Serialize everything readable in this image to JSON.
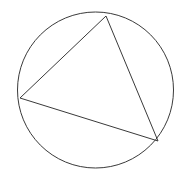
{
  "figure": {
    "background_color": "#ffffff",
    "stroke_color": "#3a3a3a",
    "stroke_width": 1,
    "canvas": {
      "width": 190,
      "height": 181
    },
    "circle": {
      "name": "circumscribed-circle",
      "center_x": 95.5,
      "center_y": 90,
      "radius": 78,
      "fill": "none"
    },
    "triangle": {
      "name": "inscribed-triangle",
      "fill": "none",
      "points": "106,16 20,98 158,141",
      "vertices": [
        {
          "label": "",
          "x": 106,
          "y": 16
        },
        {
          "label": "",
          "x": 20,
          "y": 98
        },
        {
          "label": "",
          "x": 158,
          "y": 141
        }
      ]
    }
  }
}
